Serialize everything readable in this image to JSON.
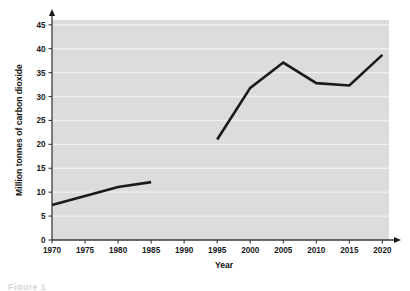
{
  "figure": {
    "background_color": "#ffffff",
    "plot_background_color": "#dcdcdc",
    "gridline_color": "#f0f0f0",
    "line_color": "#1a1a1a",
    "axis_color": "#3a3a3a",
    "caption_stub": "Figure 1"
  },
  "chart_data": {
    "type": "line",
    "title": "",
    "xlabel": "Year",
    "ylabel": "Million tonnes of carbon dioxide",
    "xlim": [
      1970,
      2021
    ],
    "ylim": [
      0,
      46
    ],
    "xticks": [
      1970,
      1975,
      1980,
      1985,
      1990,
      1995,
      2000,
      2005,
      2010,
      2015,
      2020
    ],
    "yticks": [
      0,
      5,
      10,
      15,
      20,
      25,
      30,
      35,
      40,
      45
    ],
    "xtick_labels": [
      "1970",
      "1975",
      "1980",
      "1985",
      "1990",
      "1995",
      "2000",
      "2005",
      "2010",
      "2015",
      "2020"
    ],
    "ytick_labels": [
      "0",
      "5",
      "10",
      "15",
      "20",
      "25",
      "30",
      "35",
      "40",
      "45"
    ],
    "grid": true,
    "grid_axis": "y",
    "legend": false,
    "legend_position": "none",
    "series": [
      {
        "name": "Segment 1",
        "x": [
          1970,
          1980,
          1985
        ],
        "values": [
          7.3,
          11.1,
          12.1
        ]
      },
      {
        "name": "Segment 2",
        "x": [
          1995,
          2000,
          2005,
          2010,
          2015,
          2020
        ],
        "values": [
          21.0,
          31.8,
          37.1,
          32.8,
          32.3,
          38.7
        ]
      }
    ],
    "annotations": []
  }
}
